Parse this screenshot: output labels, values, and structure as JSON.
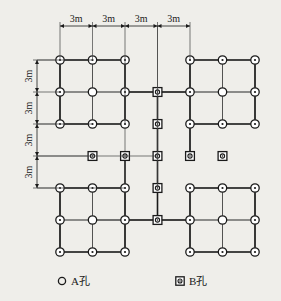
{
  "diagram": {
    "grid": {
      "x_positions": [
        60,
        92.5,
        125,
        157.5,
        190,
        222.5,
        255
      ],
      "y_positions": [
        60,
        92,
        124,
        156,
        188,
        220,
        252
      ],
      "spacing_label": "3m",
      "spacing_value_m": 3
    },
    "dimensions": {
      "top": {
        "labels": [
          "3m",
          "3m",
          "3m",
          "3m"
        ],
        "tick_x": [
          60,
          92.5,
          125,
          157.5,
          190
        ],
        "line_y": 26,
        "extension_bottom_y": [
          60,
          60,
          124,
          188,
          60
        ]
      },
      "left": {
        "labels": [
          "3m",
          "3m",
          "3m",
          "3m"
        ],
        "tick_y": [
          60,
          92,
          124,
          156,
          188
        ],
        "line_x": 37,
        "extension_right_x": [
          92.5,
          60,
          92.5,
          157.5,
          125
        ]
      }
    },
    "nodes": [
      {
        "col": 0,
        "row": 0,
        "type": "A"
      },
      {
        "col": 1,
        "row": 0,
        "type": "A"
      },
      {
        "col": 2,
        "row": 0,
        "type": "A"
      },
      {
        "col": 4,
        "row": 0,
        "type": "A"
      },
      {
        "col": 5,
        "row": 0,
        "type": "A"
      },
      {
        "col": 6,
        "row": 0,
        "type": "A"
      },
      {
        "col": 0,
        "row": 1,
        "type": "A"
      },
      {
        "col": 1,
        "row": 1,
        "type": "plain"
      },
      {
        "col": 2,
        "row": 1,
        "type": "A"
      },
      {
        "col": 3,
        "row": 1,
        "type": "B"
      },
      {
        "col": 4,
        "row": 1,
        "type": "A"
      },
      {
        "col": 5,
        "row": 1,
        "type": "plain"
      },
      {
        "col": 6,
        "row": 1,
        "type": "A"
      },
      {
        "col": 0,
        "row": 2,
        "type": "A"
      },
      {
        "col": 1,
        "row": 2,
        "type": "A"
      },
      {
        "col": 2,
        "row": 2,
        "type": "A"
      },
      {
        "col": 3,
        "row": 2,
        "type": "B"
      },
      {
        "col": 4,
        "row": 2,
        "type": "A"
      },
      {
        "col": 5,
        "row": 2,
        "type": "A"
      },
      {
        "col": 6,
        "row": 2,
        "type": "A"
      },
      {
        "col": 1,
        "row": 3,
        "type": "B"
      },
      {
        "col": 2,
        "row": 3,
        "type": "B"
      },
      {
        "col": 3,
        "row": 3,
        "type": "B"
      },
      {
        "col": 4,
        "row": 3,
        "type": "B"
      },
      {
        "col": 5,
        "row": 3,
        "type": "B"
      },
      {
        "col": 0,
        "row": 4,
        "type": "A"
      },
      {
        "col": 1,
        "row": 4,
        "type": "A"
      },
      {
        "col": 2,
        "row": 4,
        "type": "A"
      },
      {
        "col": 3,
        "row": 4,
        "type": "B"
      },
      {
        "col": 4,
        "row": 4,
        "type": "A"
      },
      {
        "col": 5,
        "row": 4,
        "type": "A"
      },
      {
        "col": 6,
        "row": 4,
        "type": "A"
      },
      {
        "col": 0,
        "row": 5,
        "type": "A"
      },
      {
        "col": 1,
        "row": 5,
        "type": "plain"
      },
      {
        "col": 2,
        "row": 5,
        "type": "A"
      },
      {
        "col": 3,
        "row": 5,
        "type": "B"
      },
      {
        "col": 4,
        "row": 5,
        "type": "A"
      },
      {
        "col": 5,
        "row": 5,
        "type": "plain"
      },
      {
        "col": 6,
        "row": 5,
        "type": "A"
      },
      {
        "col": 0,
        "row": 6,
        "type": "A"
      },
      {
        "col": 1,
        "row": 6,
        "type": "A"
      },
      {
        "col": 2,
        "row": 6,
        "type": "A"
      },
      {
        "col": 4,
        "row": 6,
        "type": "A"
      },
      {
        "col": 5,
        "row": 6,
        "type": "A"
      },
      {
        "col": 6,
        "row": 6,
        "type": "A"
      }
    ],
    "block_outlines": [
      {
        "name": "top-left-block",
        "cols": [
          0,
          2
        ],
        "rows": [
          0,
          2
        ]
      },
      {
        "name": "top-right-block",
        "cols": [
          4,
          6
        ],
        "rows": [
          0,
          2
        ]
      },
      {
        "name": "bottom-left-block",
        "cols": [
          0,
          2
        ],
        "rows": [
          4,
          6
        ]
      },
      {
        "name": "bottom-right-block",
        "cols": [
          4,
          6
        ],
        "rows": [
          4,
          6
        ]
      }
    ],
    "connector_segments": [
      {
        "name": "upper-left-stub",
        "x1": 125,
        "y1": 92,
        "x2": 190,
        "y2": 92
      },
      {
        "name": "lower-right-stub",
        "x1": 92.5,
        "y1": 220,
        "x2": 190,
        "y2": 220
      },
      {
        "name": "left-edge-row2",
        "x1": 37,
        "y1": 124,
        "x2": 60,
        "y2": 124
      },
      {
        "name": "left-edge-row3",
        "x1": 37,
        "y1": 156,
        "x2": 92.5,
        "y2": 156
      },
      {
        "name": "left-edge-row0",
        "x1": 37,
        "y1": 60,
        "x2": 60,
        "y2": 60
      },
      {
        "name": "left-edge-row4",
        "x1": 37,
        "y1": 188,
        "x2": 60,
        "y2": 188
      },
      {
        "name": "center-vertical-upper",
        "x1": 157.5,
        "y1": 26,
        "x2": 157.5,
        "y2": 92
      },
      {
        "name": "center-vertical-lower",
        "x1": 157.5,
        "y1": 188,
        "x2": 157.5,
        "y2": 220
      },
      {
        "name": "mid-vertical-left",
        "x1": 125,
        "y1": 124,
        "x2": 125,
        "y2": 156
      },
      {
        "name": "mid-vertical-right",
        "x1": 190,
        "y1": 124,
        "x2": 190,
        "y2": 156
      }
    ],
    "legend": {
      "items": [
        {
          "symbol": "circle",
          "label": "A孔",
          "name": "legend-a-hole"
        },
        {
          "symbol": "square-dot",
          "label": "B孔",
          "name": "legend-b-hole"
        }
      ]
    },
    "colors": {
      "background": "#efeeea",
      "line": "#1a1a1a",
      "thin_line": "#444444",
      "text": "#1a1a1a"
    }
  }
}
